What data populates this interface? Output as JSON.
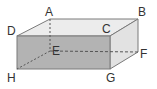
{
  "diagram": {
    "type": "rectangular-prism",
    "vertices": {
      "A": {
        "label": "A"
      },
      "B": {
        "label": "B"
      },
      "C": {
        "label": "C"
      },
      "D": {
        "label": "D"
      },
      "E": {
        "label": "E"
      },
      "F": {
        "label": "F"
      },
      "G": {
        "label": "G"
      },
      "H": {
        "label": "H"
      }
    },
    "colors": {
      "front_face": "#b3b3b3",
      "top_face": "#ececec",
      "side_face": "#e2e2e2",
      "edge": "#777777"
    }
  }
}
